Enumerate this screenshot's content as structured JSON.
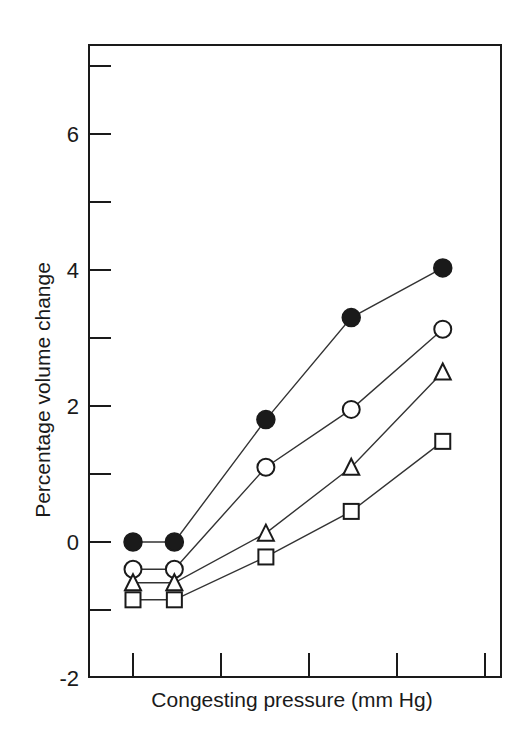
{
  "chart_data": {
    "type": "line",
    "title": "",
    "xlabel": "Congesting pressure (mm Hg)",
    "ylabel": "Percentage volume change",
    "ylim": [
      -2,
      7.2
    ],
    "yticks_major": [
      -2,
      0,
      2,
      4,
      6
    ],
    "yticks_minor": [
      -1,
      1,
      3,
      5,
      7
    ],
    "ytick_labels": [
      "-2",
      "0",
      "2",
      "4",
      "6"
    ],
    "xticks": [
      0,
      1,
      2,
      3,
      4
    ],
    "xtick_labels": [
      "",
      "",
      "",
      "",
      ""
    ],
    "x": [
      0,
      0.47,
      1.51,
      2.48,
      3.52
    ],
    "grid": false,
    "legend": "none",
    "series": [
      {
        "name": "filled-circle",
        "marker": "circle-filled",
        "values": [
          0.0,
          0.0,
          1.8,
          3.3,
          4.03
        ]
      },
      {
        "name": "open-circle",
        "marker": "circle-open",
        "values": [
          -0.4,
          -0.4,
          1.1,
          1.95,
          3.13
        ]
      },
      {
        "name": "open-triangle",
        "marker": "triangle-open",
        "values": [
          -0.6,
          -0.6,
          0.13,
          1.1,
          2.5
        ]
      },
      {
        "name": "open-square",
        "marker": "square-open",
        "values": [
          -0.85,
          -0.85,
          -0.22,
          0.45,
          1.48
        ]
      }
    ]
  },
  "layout": {
    "frame": {
      "left": 89,
      "top": 45,
      "right": 501,
      "bottom": 677
    },
    "y0_px": 542,
    "px_per_unit_y": 68,
    "x0_px": 133,
    "px_per_unit_x": 88,
    "ink_color": "#1a1a1a",
    "line_color": "#333333"
  }
}
